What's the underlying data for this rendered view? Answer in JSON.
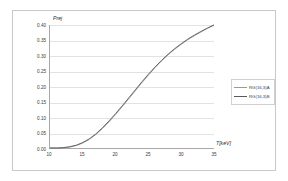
{
  "chart_data": {
    "type": "line",
    "title": "",
    "xlabel": "T[keV]",
    "ylabel": "Prej",
    "xlim": [
      10,
      35
    ],
    "ylim": [
      0.0,
      0.4
    ],
    "grid": true,
    "legend_position": "right",
    "xticks": [
      "10",
      "15",
      "20",
      "25",
      "30",
      "35"
    ],
    "xtick_values": [
      10,
      15,
      20,
      25,
      30,
      35
    ],
    "yticks": [
      "0.00",
      "0.05",
      "0.10",
      "0.15",
      "0.20",
      "0.25",
      "0.30",
      "0.35",
      "0.40"
    ],
    "ytick_values": [
      0.0,
      0.05,
      0.1,
      0.15,
      0.2,
      0.25,
      0.3,
      0.35,
      0.4
    ],
    "x": [
      10,
      11,
      12,
      13,
      14,
      15,
      16,
      17,
      18,
      19,
      20,
      21,
      22,
      23,
      24,
      25,
      26,
      27,
      28,
      29,
      30,
      31,
      32,
      33,
      34,
      35
    ],
    "series": [
      {
        "name": "RG(16,3)A",
        "color": "#9a9a9a",
        "values": [
          0.0,
          0.0,
          0.001,
          0.003,
          0.008,
          0.016,
          0.028,
          0.044,
          0.063,
          0.085,
          0.109,
          0.134,
          0.16,
          0.186,
          0.212,
          0.237,
          0.261,
          0.283,
          0.303,
          0.321,
          0.337,
          0.352,
          0.365,
          0.377,
          0.389,
          0.4
        ]
      },
      {
        "name": "RG(16,3)B",
        "color": "#5a5a5a",
        "values": [
          0.0,
          0.0,
          0.001,
          0.004,
          0.009,
          0.018,
          0.03,
          0.046,
          0.066,
          0.088,
          0.112,
          0.137,
          0.163,
          0.189,
          0.215,
          0.24,
          0.263,
          0.285,
          0.305,
          0.323,
          0.339,
          0.354,
          0.367,
          0.379,
          0.39,
          0.4
        ]
      }
    ]
  }
}
